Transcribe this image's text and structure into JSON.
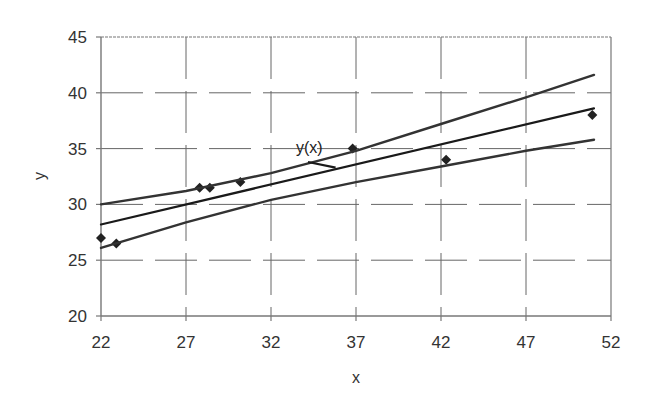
{
  "chart_data": {
    "type": "scatter",
    "title": "",
    "xlabel": "x",
    "ylabel": "y",
    "xlim": [
      22,
      52
    ],
    "ylim": [
      20,
      45
    ],
    "x_ticks": [
      22,
      27,
      32,
      37,
      42,
      47,
      52
    ],
    "y_ticks": [
      20,
      25,
      30,
      35,
      40,
      45
    ],
    "grid": true,
    "grid_style": "dashed",
    "legend": null,
    "annotations": [
      {
        "text": "y(x)",
        "points_to": "regression-line",
        "x": 35.8,
        "y": 33.3
      }
    ],
    "series": [
      {
        "name": "data-points",
        "type": "scatter",
        "marker": "diamond",
        "x": [
          22,
          22.9,
          27.8,
          28.4,
          30.2,
          36.8,
          42.3,
          50.9
        ],
        "y": [
          27,
          26.5,
          31.5,
          31.5,
          32,
          35,
          34,
          38
        ]
      },
      {
        "name": "y(x)",
        "type": "line",
        "x": [
          22,
          51
        ],
        "y": [
          28.2,
          38.6
        ]
      },
      {
        "name": "upper-confidence-bound",
        "type": "line",
        "x": [
          22,
          27,
          32,
          37,
          42,
          47,
          51
        ],
        "y": [
          30.0,
          31.2,
          32.8,
          34.8,
          37.2,
          39.6,
          41.6
        ]
      },
      {
        "name": "lower-confidence-bound",
        "type": "line",
        "x": [
          22,
          27,
          32,
          37,
          42,
          47,
          51
        ],
        "y": [
          26.1,
          28.4,
          30.4,
          32.0,
          33.4,
          34.8,
          35.8
        ]
      }
    ]
  },
  "layout": {
    "plot": {
      "left": 101,
      "right": 611,
      "top": 37,
      "bottom": 316
    },
    "colors": {
      "axis": "#777777",
      "grid": "#666666",
      "line": "#1a1a1a",
      "band": "#333333",
      "marker": "#222222",
      "text": "#333333"
    }
  }
}
